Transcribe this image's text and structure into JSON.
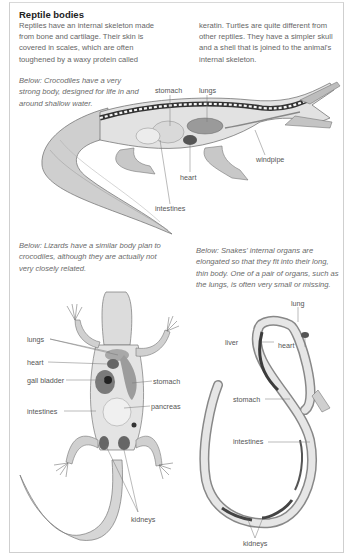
{
  "page": {
    "title": "Reptile bodies",
    "intro_left": "Reptiles have an internal skeleton made from bone and cartilage. Their skin is covered in scales, which are often toughened by a waxy protein called",
    "intro_right": "keratin. Turtles are quite different from other reptiles. They have a simpler skull and a shell that is joined to the animal's internal skeleton."
  },
  "crocodile": {
    "caption": "Below: Crocodiles have a very strong body, designed for life in and around shallow water.",
    "labels": {
      "stomach": "stomach",
      "lungs": "lungs",
      "windpipe": "windpipe",
      "heart": "heart",
      "intestines": "intestines"
    }
  },
  "lizard": {
    "caption": "Below: Lizards have a similar body plan to crocodiles, although they are actually not very closely related.",
    "labels": {
      "lungs": "lungs",
      "heart": "heart",
      "gall_bladder": "gall bladder",
      "intestines": "intestines",
      "stomach": "stomach",
      "pancreas": "pancreas",
      "kidneys": "kidneys"
    }
  },
  "snake": {
    "caption": "Below: Snakes' internal organs are elongated so that they fit into their long, thin body. One of a pair of organs, such as the lungs, is often very small or missing.",
    "labels": {
      "lung": "lung",
      "liver": "liver",
      "heart": "heart",
      "stomach": "stomach",
      "intestines": "intestines",
      "kidneys": "kidneys"
    }
  }
}
